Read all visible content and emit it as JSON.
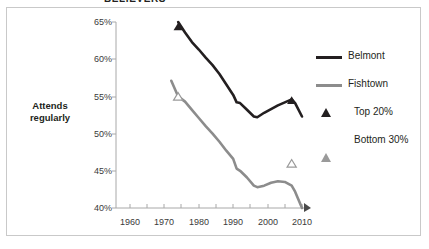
{
  "title": "BELIEVERS",
  "axis_title": "Attends\nregularly",
  "axis_title_line1": "Attends",
  "axis_title_line2": "regularly",
  "legend": {
    "items": [
      {
        "label": "Belmont",
        "kind": "line",
        "color": "#231f20"
      },
      {
        "label": "Fishtown",
        "kind": "line",
        "color": "#8c8c8c"
      },
      {
        "label": "Top 20%",
        "kind": "triangle-filled",
        "color": "#231f20"
      },
      {
        "label": "Bottom 30%",
        "kind": "triangle-open",
        "color": "#9a9a9a"
      }
    ]
  },
  "chart_data": {
    "type": "line",
    "title": "BELIEVERS",
    "xlabel": "",
    "ylabel": "Attends regularly",
    "xlim": [
      1958,
      2012
    ],
    "ylim": [
      40,
      65
    ],
    "yticks": [
      "40%",
      "45%",
      "50%",
      "55%",
      "60%",
      "65%"
    ],
    "ytick_values": [
      40,
      45,
      50,
      55,
      60,
      65
    ],
    "xticks": [
      "1960",
      "1970",
      "1980",
      "1990",
      "2000",
      "2010"
    ],
    "xtick_values": [
      1960,
      1970,
      1980,
      1990,
      2000,
      2010
    ],
    "minor_xtick_interval": 5,
    "grid": false,
    "legend_position": "right",
    "y_axis_format": "percent",
    "series": [
      {
        "name": "Belmont",
        "group": "Top 20%",
        "color": "#231f20",
        "x": [
          1974,
          1976,
          1978,
          1980,
          1982,
          1984,
          1986,
          1988,
          1990,
          1991,
          1992,
          1994,
          1996,
          1997,
          1999,
          2001,
          2003,
          2005,
          2007,
          2008,
          2010
        ],
        "values": [
          65.0,
          63.6,
          62.3,
          61.3,
          60.2,
          59.2,
          58.0,
          56.6,
          55.2,
          54.2,
          54.1,
          53.2,
          52.3,
          52.2,
          52.8,
          53.3,
          53.8,
          54.2,
          54.6,
          54.1,
          52.3
        ]
      },
      {
        "name": "Fishtown",
        "group": "Bottom 30%",
        "color": "#8c8c8c",
        "x": [
          1972,
          1974,
          1976,
          1978,
          1980,
          1982,
          1984,
          1986,
          1988,
          1990,
          1991,
          1992,
          1994,
          1996,
          1997,
          1999,
          2001,
          2003,
          2005,
          2007,
          2008,
          2010
        ],
        "values": [
          57.1,
          55.0,
          54.3,
          53.2,
          52.1,
          51.0,
          50.0,
          48.9,
          47.7,
          46.6,
          45.3,
          45.0,
          44.1,
          43.0,
          42.8,
          43.0,
          43.4,
          43.6,
          43.5,
          43.0,
          42.2,
          40.0
        ]
      }
    ],
    "markers": [
      {
        "series": "Belmont",
        "kind": "triangle-filled",
        "x": 1974,
        "y": 64.4,
        "label": "Top 20%"
      },
      {
        "series": "Belmont",
        "kind": "triangle-filled",
        "x": 2007,
        "y": 54.5,
        "label": "Top 20%"
      },
      {
        "series": "Fishtown",
        "kind": "triangle-open",
        "x": 1974,
        "y": 55.0,
        "label": "Bottom 30%"
      },
      {
        "series": "Fishtown",
        "kind": "triangle-open",
        "x": 2007,
        "y": 46.0,
        "label": "Bottom 30%"
      }
    ]
  }
}
